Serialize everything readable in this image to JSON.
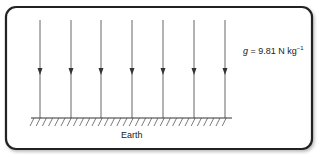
{
  "diagram": {
    "field_label": {
      "symbol": "g",
      "equals": " = ",
      "value": "9.81",
      "unit": " N kg",
      "exponent": "−1"
    },
    "ground_label": "Earth",
    "field_lines_count": 7,
    "field_line_x": [
      40,
      71,
      101,
      132,
      163,
      194,
      225
    ],
    "colors": {
      "border": "#222222",
      "lines": "#555555",
      "background": "#ffffff"
    }
  }
}
